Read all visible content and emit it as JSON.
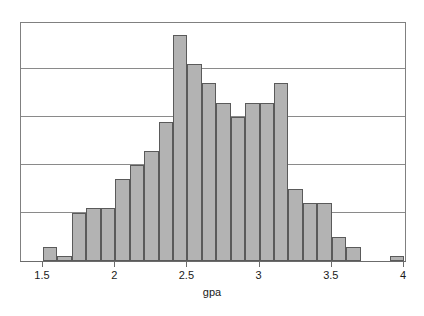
{
  "chart_data": {
    "type": "bar",
    "title": "",
    "xlabel": "gpa",
    "ylabel": "",
    "grid": true,
    "legend": null,
    "bin_width": 0.1,
    "xlim": [
      1.4,
      4.05
    ],
    "ylim": [
      0,
      50
    ],
    "xticks": [
      1.5,
      2,
      2.5,
      3,
      3.5,
      4
    ],
    "xtick_labels": [
      "1.5",
      "2",
      "2.5",
      "3",
      "3.5",
      "4"
    ],
    "ytick_labels": [],
    "gridline_values": [
      10,
      20,
      30,
      40,
      50
    ],
    "bar_fill_color": "#b3b3b3",
    "bar_edge_color": "#5a5a5a",
    "frame_color": "#808080",
    "categories": [
      "1.5-1.6",
      "1.6-1.7",
      "1.7-1.8",
      "1.8-1.9",
      "1.9-2.0",
      "2.0-2.1",
      "2.1-2.2",
      "2.2-2.3",
      "2.3-2.4",
      "2.4-2.5",
      "2.5-2.6",
      "2.6-2.7",
      "2.7-2.8",
      "2.8-2.9",
      "2.9-3.0",
      "3.0-3.1",
      "3.1-3.2",
      "3.2-3.3",
      "3.3-3.4",
      "3.4-3.5",
      "3.5-3.6",
      "3.6-3.7",
      "3.9-4.0"
    ],
    "bin_starts": [
      1.5,
      1.6,
      1.7,
      1.8,
      1.9,
      2.0,
      2.1,
      2.2,
      2.3,
      2.4,
      2.5,
      2.6,
      2.7,
      2.8,
      2.9,
      3.0,
      3.1,
      3.2,
      3.3,
      3.4,
      3.5,
      3.6,
      3.9
    ],
    "values": [
      3,
      1,
      10,
      11,
      11,
      17,
      20,
      23,
      29,
      47,
      41,
      37,
      33,
      30,
      33,
      33,
      37,
      15,
      12,
      12,
      5,
      3,
      1
    ]
  },
  "axis": {
    "x_label": "gpa"
  }
}
